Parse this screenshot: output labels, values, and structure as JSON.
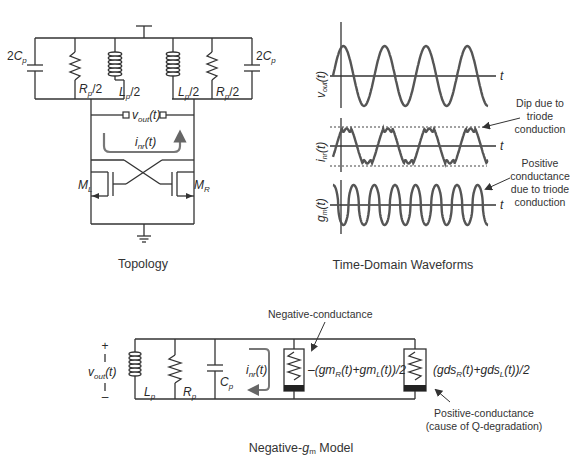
{
  "topology": {
    "caption": "Topology",
    "components": {
      "cap_left": {
        "coef": "2",
        "sym": "C",
        "sub": "p"
      },
      "cap_right": {
        "coef": "2",
        "sym": "C",
        "sub": "p"
      },
      "res_left": {
        "sym": "R",
        "sub": "p",
        "suffix": "/2"
      },
      "res_right": {
        "sym": "R",
        "sub": "p",
        "suffix": "/2"
      },
      "ind_left": {
        "sym": "L",
        "sub": "p",
        "suffix": "/2"
      },
      "ind_right": {
        "sym": "L",
        "sub": "p",
        "suffix": "/2"
      }
    },
    "vout": {
      "sym": "v",
      "sub": "out",
      "arg": "(t)"
    },
    "inr": {
      "sym": "i",
      "sub": "nr",
      "arg": "(t)"
    },
    "transistor_left": {
      "sym": "M",
      "sub": "L"
    },
    "transistor_right": {
      "sym": "M",
      "sub": "R"
    }
  },
  "waveforms": {
    "caption": "Time-Domain Waveforms",
    "plots": [
      {
        "ylabel_sym": "v",
        "ylabel_sub": "out",
        "ylabel_arg": "(t)",
        "xlabel": "t"
      },
      {
        "ylabel_sym": "i",
        "ylabel_sub": "nr",
        "ylabel_arg": "(t)",
        "xlabel": "t"
      },
      {
        "ylabel_sym": "g",
        "ylabel_sub": "m",
        "ylabel_arg": "(t)",
        "xlabel": "t"
      }
    ],
    "annotations": {
      "dip": [
        "Dip due to",
        "triode",
        "conduction"
      ],
      "positive": [
        "Positive",
        "conductance",
        "due to triode",
        "conduction"
      ]
    }
  },
  "model": {
    "caption_pre": "Negative-",
    "caption_sym": "g",
    "caption_sub": "m",
    "caption_post": " Model",
    "plus": "+",
    "minus": "–",
    "vout": {
      "sym": "v",
      "sub": "out",
      "arg": "(t)"
    },
    "Lp": {
      "sym": "L",
      "sub": "p"
    },
    "Rp": {
      "sym": "R",
      "sub": "p"
    },
    "Cp": {
      "sym": "C",
      "sub": "p"
    },
    "inr": {
      "sym": "i",
      "sub": "nr",
      "arg": "(t)"
    },
    "neg_label": "Negative-conductance",
    "neg_expr": {
      "p1": "–(gm",
      "s1": "R",
      "p2": "(t)+gm",
      "s2": "L",
      "p3": "(t))/2"
    },
    "pos_expr": {
      "p1": "(gds",
      "s1": "R",
      "p2": "(t)+gds",
      "s2": "L",
      "p3": "(t))/2"
    },
    "pos_label": [
      "Positive-conductance",
      "(cause of Q-degradation)"
    ]
  }
}
